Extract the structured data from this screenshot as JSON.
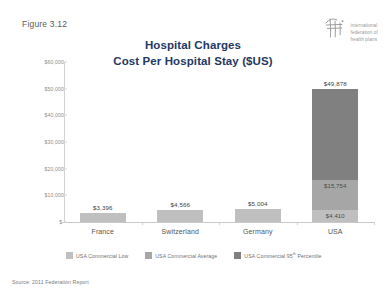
{
  "figure": {
    "label": "Figure 3.12"
  },
  "logo": {
    "icon": "ifhp-logo-icon",
    "line1": "international",
    "line2": "federation of",
    "line3": "health plans"
  },
  "source": {
    "text": "Source: 2011 Federation Report"
  },
  "chart_data": {
    "type": "bar",
    "subtype": "stacked-bar",
    "title": "Hospital Charges",
    "subtitle": "Cost Per Hospital Stay ($US)",
    "xlabel": "",
    "ylabel": "",
    "categories": [
      "France",
      "Switzerland",
      "Germany",
      "USA"
    ],
    "ylim": [
      0,
      60000
    ],
    "yticks": [
      0,
      10000,
      20000,
      30000,
      40000,
      50000,
      60000
    ],
    "ytick_labels": [
      "$-",
      "$10,000",
      "$20,000",
      "$30,000",
      "$40,000",
      "$50,000",
      "$60,000"
    ],
    "grid": false,
    "legend_position": "bottom",
    "series": [
      {
        "name": "USA Commercial Low",
        "color": "#bfbfbf",
        "values": [
          3396,
          4566,
          5004,
          4410
        ],
        "labels": [
          "$3,396",
          "$4,566",
          "$5,004",
          "$4,410"
        ]
      },
      {
        "name": "USA Commercial Average",
        "color": "#a6a6a6",
        "values": [
          0,
          0,
          0,
          11344
        ],
        "labels": [
          "",
          "",
          "",
          "$15,754"
        ],
        "cumulative_label_value": 15754
      },
      {
        "name": "USA Commercial 95th Percentile",
        "color": "#808080",
        "values": [
          0,
          0,
          0,
          34124
        ],
        "labels": [
          "",
          "",
          "",
          "$49,878"
        ],
        "cumulative_label_value": 49878
      }
    ],
    "annotations": [
      {
        "category": "France",
        "text": "$3,396",
        "position": "above-bar"
      },
      {
        "category": "Switzerland",
        "text": "$4,566",
        "position": "above-bar"
      },
      {
        "category": "Germany",
        "text": "$5,004",
        "position": "above-bar"
      },
      {
        "category": "USA",
        "text": "$4,410",
        "position": "in-segment-low"
      },
      {
        "category": "USA",
        "text": "$15,754",
        "position": "in-segment-average"
      },
      {
        "category": "USA",
        "text": "$49,878",
        "position": "above-bar"
      }
    ]
  },
  "legend": {
    "items": [
      {
        "label": "USA Commercial Low",
        "color": "#bfbfbf"
      },
      {
        "label": "USA Commercial Average",
        "color": "#a6a6a6"
      },
      {
        "label_main": "USA Commercial 95",
        "label_sup": "th",
        "label_tail": " Percentile",
        "color": "#808080"
      }
    ]
  },
  "colors": {
    "title": "#1f3864",
    "low": "#bfbfbf",
    "average": "#a6a6a6",
    "percentile95": "#808080"
  }
}
